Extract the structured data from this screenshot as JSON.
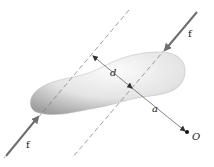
{
  "diagram": {
    "type": "couple-moment-illustration",
    "labels": {
      "force_top": "f",
      "force_bottom": "f",
      "distance": "d",
      "arm": "a",
      "point": "O"
    },
    "colors": {
      "arrow": "#6e6e6e",
      "dashed": "#777777",
      "body_light": "#f4f4f4",
      "body_dark": "#a9a9a9",
      "dimension": "#333333"
    }
  }
}
